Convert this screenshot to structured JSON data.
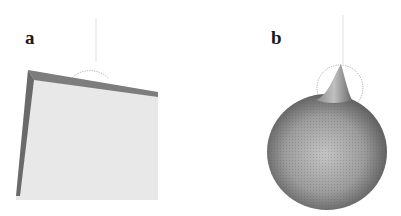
{
  "figure": {
    "panels": [
      {
        "label": "a",
        "content": "cube-rendering-with-dotted-sphere-outline"
      },
      {
        "label": "b",
        "content": "sphere-rendering-with-spike-and-dotted-sphere-outline"
      }
    ],
    "colors": {
      "background": "#ffffff",
      "cube_face": "#e6e6e6",
      "cube_edge": "#7a7a7a",
      "sphere_mid": "#9a9a9a",
      "sphere_dark": "#4a4a4a",
      "label": "#1a1a1a"
    }
  }
}
